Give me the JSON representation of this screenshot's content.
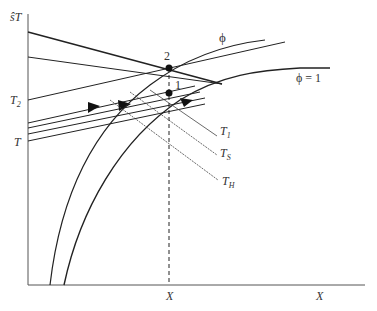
{
  "diagram": {
    "type": "temperature-conversion diagram",
    "axes": {
      "y_label": "ŝT",
      "x_label": "X",
      "y_ticks": [
        {
          "label_main": "T",
          "label_sub": "2"
        },
        {
          "label_main": "T",
          "label_sub": ""
        }
      ],
      "x_ticks": [
        {
          "label": "X"
        }
      ]
    },
    "curves": [
      {
        "id": "phi",
        "label": "ϕ"
      },
      {
        "id": "phi-eq-1",
        "label": "ϕ = 1"
      }
    ],
    "points": [
      {
        "id": "2",
        "label": "2"
      },
      {
        "id": "1",
        "label": "1"
      }
    ],
    "isotherms": [
      {
        "label_main": "T",
        "label_sub": "1"
      },
      {
        "label_main": "T",
        "label_sub": "S"
      },
      {
        "label_main": "T",
        "label_sub": "H"
      }
    ],
    "colors": {
      "line": "#222222",
      "axis": "#555555",
      "text": "#333333"
    }
  }
}
